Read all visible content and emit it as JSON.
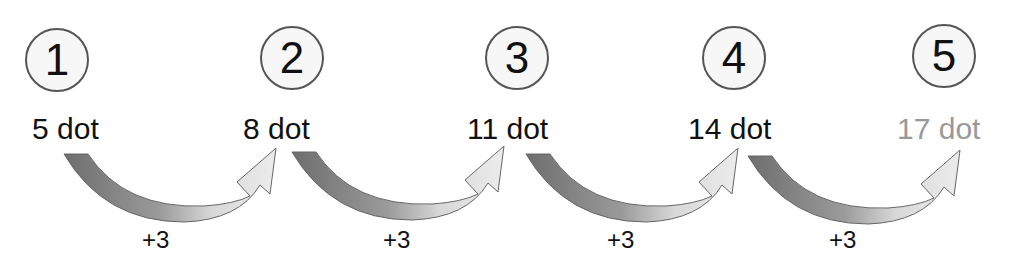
{
  "steps": [
    {
      "number": "1",
      "label": "5 dot",
      "value": 5
    },
    {
      "number": "2",
      "label": "8 dot",
      "value": 8
    },
    {
      "number": "3",
      "label": "11 dot",
      "value": 11
    },
    {
      "number": "4",
      "label": "14 dot",
      "value": 14
    },
    {
      "number": "5",
      "label": "17 dot",
      "value": 17
    }
  ],
  "increments": [
    "+3",
    "+3",
    "+3",
    "+3"
  ],
  "colors": {
    "circle_border": "#555555",
    "faded_label": "#999999",
    "arrow_dark": "#707070",
    "arrow_light": "#e6e6e6"
  }
}
